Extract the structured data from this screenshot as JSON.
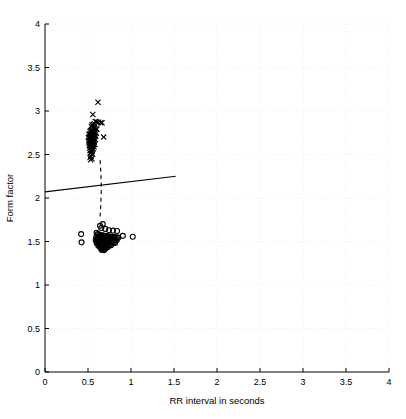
{
  "chart_data": {
    "type": "scatter",
    "title": "",
    "xlabel": "RR interval in seconds",
    "ylabel": "Form factor",
    "xlim": [
      0,
      4
    ],
    "ylim": [
      0,
      4
    ],
    "xticks": [
      0,
      0.5,
      1,
      1.5,
      2,
      2.5,
      3,
      3.5,
      4
    ],
    "xticklabels": [
      "0",
      "0.5",
      "1",
      "1.5",
      "2",
      "2.5",
      "3",
      "3.5",
      "4"
    ],
    "yticks": [
      0,
      0.5,
      1,
      1.5,
      2,
      2.5,
      3,
      3.5,
      4
    ],
    "yticklabels": [
      "0",
      "0.5",
      "1",
      "1.5",
      "2",
      "2.5",
      "3",
      "3.5",
      "4"
    ],
    "grid": true,
    "grid_style": "dotted",
    "grid_color": "#e8e8e8",
    "legend": "none",
    "marker_color": "#000000",
    "series": [
      {
        "name": "cluster-x-upper",
        "marker": "x",
        "points": [
          [
            0.616,
            3.1
          ],
          [
            0.556,
            2.96
          ],
          [
            0.585,
            2.88
          ],
          [
            0.6,
            2.875
          ],
          [
            0.62,
            2.87
          ],
          [
            0.648,
            2.865
          ],
          [
            0.663,
            2.865
          ],
          [
            0.573,
            2.855
          ],
          [
            0.561,
            2.845
          ],
          [
            0.546,
            2.84
          ],
          [
            0.54,
            2.82
          ],
          [
            0.558,
            2.81
          ],
          [
            0.572,
            2.8
          ],
          [
            0.59,
            2.795
          ],
          [
            0.604,
            2.79
          ],
          [
            0.545,
            2.78
          ],
          [
            0.533,
            2.775
          ],
          [
            0.524,
            2.765
          ],
          [
            0.552,
            2.76
          ],
          [
            0.566,
            2.755
          ],
          [
            0.58,
            2.75
          ],
          [
            0.596,
            2.745
          ],
          [
            0.536,
            2.74
          ],
          [
            0.521,
            2.735
          ],
          [
            0.512,
            2.73
          ],
          [
            0.548,
            2.725
          ],
          [
            0.562,
            2.72
          ],
          [
            0.576,
            2.715
          ],
          [
            0.59,
            2.71
          ],
          [
            0.528,
            2.705
          ],
          [
            0.516,
            2.7
          ],
          [
            0.506,
            2.695
          ],
          [
            0.544,
            2.69
          ],
          [
            0.558,
            2.685
          ],
          [
            0.57,
            2.68
          ],
          [
            0.586,
            2.675
          ],
          [
            0.682,
            2.7
          ],
          [
            0.532,
            2.67
          ],
          [
            0.518,
            2.665
          ],
          [
            0.508,
            2.66
          ],
          [
            0.546,
            2.655
          ],
          [
            0.56,
            2.65
          ],
          [
            0.574,
            2.645
          ],
          [
            0.524,
            2.64
          ],
          [
            0.512,
            2.635
          ],
          [
            0.538,
            2.63
          ],
          [
            0.552,
            2.625
          ],
          [
            0.566,
            2.62
          ],
          [
            0.58,
            2.615
          ],
          [
            0.528,
            2.61
          ],
          [
            0.516,
            2.605
          ],
          [
            0.542,
            2.6
          ],
          [
            0.556,
            2.595
          ],
          [
            0.57,
            2.59
          ],
          [
            0.532,
            2.585
          ],
          [
            0.52,
            2.575
          ],
          [
            0.546,
            2.57
          ],
          [
            0.56,
            2.565
          ],
          [
            0.536,
            2.555
          ],
          [
            0.524,
            2.545
          ],
          [
            0.55,
            2.54
          ],
          [
            0.54,
            2.525
          ],
          [
            0.528,
            2.515
          ],
          [
            0.554,
            2.505
          ],
          [
            0.536,
            2.48
          ],
          [
            0.524,
            2.465
          ],
          [
            0.545,
            2.455
          ],
          [
            0.532,
            2.44
          ]
        ]
      },
      {
        "name": "cluster-o-lower",
        "marker": "o",
        "points": [
          [
            0.42,
            1.585
          ],
          [
            0.425,
            1.49
          ],
          [
            0.672,
            1.7
          ],
          [
            0.64,
            1.68
          ],
          [
            0.655,
            1.655
          ],
          [
            0.7,
            1.645
          ],
          [
            0.745,
            1.63
          ],
          [
            0.79,
            1.625
          ],
          [
            0.838,
            1.62
          ],
          [
            0.905,
            1.565
          ],
          [
            1.02,
            1.555
          ],
          [
            0.6,
            1.6
          ],
          [
            0.612,
            1.585
          ],
          [
            0.628,
            1.58
          ],
          [
            0.644,
            1.575
          ],
          [
            0.66,
            1.57
          ],
          [
            0.676,
            1.568
          ],
          [
            0.692,
            1.565
          ],
          [
            0.708,
            1.562
          ],
          [
            0.724,
            1.56
          ],
          [
            0.74,
            1.558
          ],
          [
            0.756,
            1.556
          ],
          [
            0.772,
            1.554
          ],
          [
            0.788,
            1.552
          ],
          [
            0.804,
            1.55
          ],
          [
            0.82,
            1.548
          ],
          [
            0.836,
            1.546
          ],
          [
            0.852,
            1.544
          ],
          [
            0.596,
            1.552
          ],
          [
            0.61,
            1.548
          ],
          [
            0.624,
            1.545
          ],
          [
            0.638,
            1.542
          ],
          [
            0.652,
            1.54
          ],
          [
            0.666,
            1.538
          ],
          [
            0.68,
            1.536
          ],
          [
            0.694,
            1.534
          ],
          [
            0.708,
            1.532
          ],
          [
            0.722,
            1.53
          ],
          [
            0.736,
            1.528
          ],
          [
            0.75,
            1.526
          ],
          [
            0.764,
            1.524
          ],
          [
            0.778,
            1.522
          ],
          [
            0.792,
            1.52
          ],
          [
            0.806,
            1.518
          ],
          [
            0.82,
            1.516
          ],
          [
            0.834,
            1.514
          ],
          [
            0.59,
            1.518
          ],
          [
            0.604,
            1.515
          ],
          [
            0.618,
            1.512
          ],
          [
            0.632,
            1.51
          ],
          [
            0.646,
            1.508
          ],
          [
            0.66,
            1.506
          ],
          [
            0.674,
            1.504
          ],
          [
            0.688,
            1.502
          ],
          [
            0.702,
            1.5
          ],
          [
            0.716,
            1.498
          ],
          [
            0.73,
            1.496
          ],
          [
            0.744,
            1.494
          ],
          [
            0.758,
            1.492
          ],
          [
            0.772,
            1.49
          ],
          [
            0.786,
            1.488
          ],
          [
            0.8,
            1.486
          ],
          [
            0.814,
            1.484
          ],
          [
            0.6,
            1.482
          ],
          [
            0.614,
            1.48
          ],
          [
            0.628,
            1.478
          ],
          [
            0.642,
            1.476
          ],
          [
            0.656,
            1.474
          ],
          [
            0.67,
            1.472
          ],
          [
            0.684,
            1.47
          ],
          [
            0.698,
            1.468
          ],
          [
            0.712,
            1.466
          ],
          [
            0.726,
            1.464
          ],
          [
            0.74,
            1.462
          ],
          [
            0.754,
            1.46
          ],
          [
            0.768,
            1.458
          ],
          [
            0.62,
            1.452
          ],
          [
            0.634,
            1.45
          ],
          [
            0.648,
            1.448
          ],
          [
            0.662,
            1.446
          ],
          [
            0.676,
            1.444
          ],
          [
            0.69,
            1.442
          ],
          [
            0.704,
            1.44
          ],
          [
            0.718,
            1.438
          ],
          [
            0.732,
            1.436
          ],
          [
            0.646,
            1.425
          ],
          [
            0.66,
            1.422
          ],
          [
            0.674,
            1.42
          ],
          [
            0.688,
            1.418
          ],
          [
            0.702,
            1.416
          ],
          [
            0.658,
            1.405
          ],
          [
            0.672,
            1.402
          ],
          [
            0.686,
            1.4
          ]
        ]
      }
    ],
    "lines": [
      {
        "name": "decision-boundary-solid",
        "style": "solid",
        "points": [
          [
            0.0,
            2.07
          ],
          [
            1.52,
            2.25
          ]
        ]
      },
      {
        "name": "decision-boundary-dashed",
        "style": "dashed",
        "points": [
          [
            0.64,
            2.435
          ],
          [
            0.65,
            2.3
          ],
          [
            0.655,
            2.1
          ],
          [
            0.648,
            1.9
          ],
          [
            0.638,
            1.755
          ]
        ]
      }
    ]
  }
}
